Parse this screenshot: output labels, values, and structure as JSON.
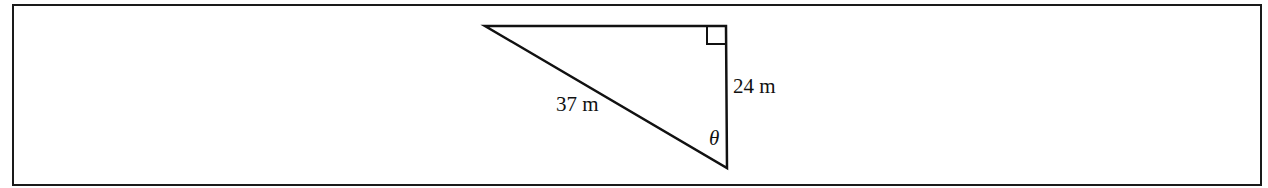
{
  "figure": {
    "type": "right-triangle",
    "labels": {
      "hypotenuse": "37 m",
      "vertical_leg": "24 m",
      "angle": "θ"
    },
    "right_angle_marker": true,
    "colors": {
      "stroke": "#111111",
      "background": "#ffffff"
    }
  }
}
